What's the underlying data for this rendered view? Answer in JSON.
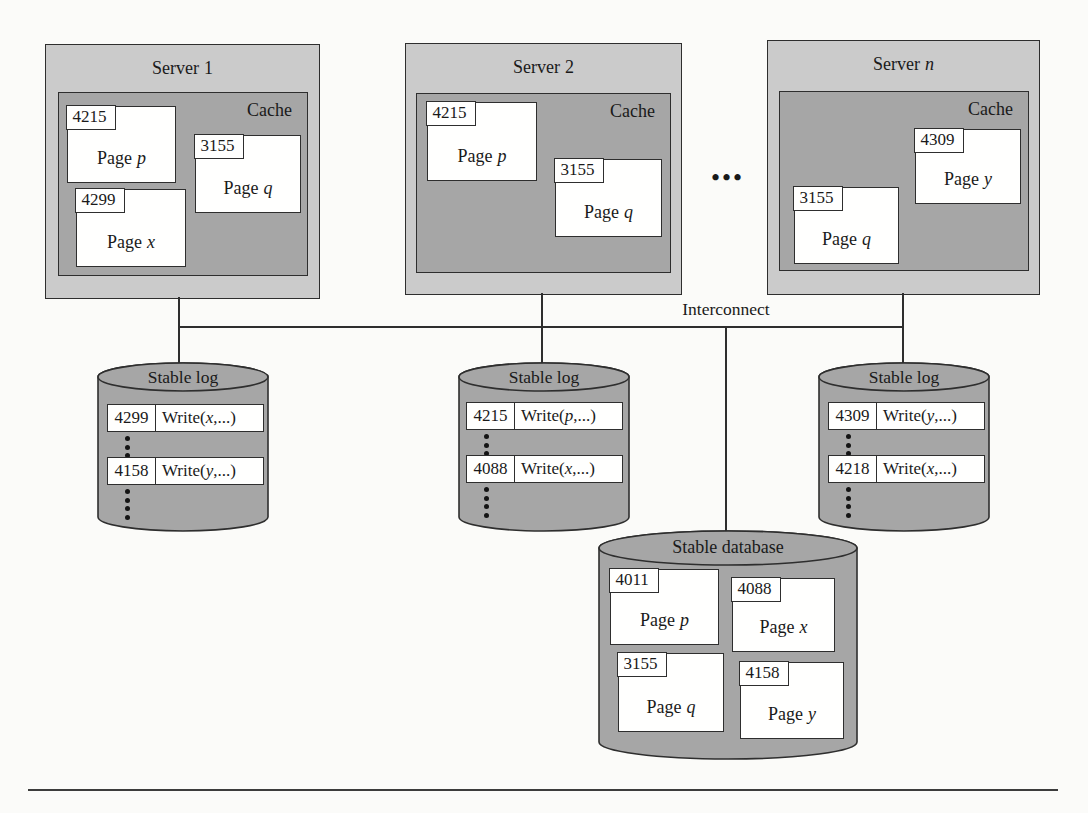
{
  "diagram": {
    "servers": [
      {
        "title_prefix": "Server",
        "title_var": "1",
        "cache_label": "Cache",
        "pages": [
          {
            "tag": "4215",
            "label": "Page",
            "var": "p"
          },
          {
            "tag": "3155",
            "label": "Page",
            "var": "q"
          },
          {
            "tag": "4299",
            "label": "Page",
            "var": "x"
          }
        ]
      },
      {
        "title_prefix": "Server",
        "title_var": "2",
        "cache_label": "Cache",
        "pages": [
          {
            "tag": "4215",
            "label": "Page",
            "var": "p"
          },
          {
            "tag": "3155",
            "label": "Page",
            "var": "q"
          }
        ]
      },
      {
        "title_prefix": "Server",
        "title_var": "n",
        "cache_label": "Cache",
        "pages": [
          {
            "tag": "4309",
            "label": "Page",
            "var": "y"
          },
          {
            "tag": "3155",
            "label": "Page",
            "var": "q"
          }
        ]
      }
    ],
    "servers_ellipsis": "•••",
    "interconnect_label": "Interconnect",
    "logs": [
      {
        "title": "Stable log",
        "records": [
          {
            "lsn": "4299",
            "prefix": "Write(",
            "var": "x",
            "suffix": ",...)"
          },
          {
            "lsn": "4158",
            "prefix": "Write(",
            "var": "y",
            "suffix": ",...)"
          }
        ]
      },
      {
        "title": "Stable log",
        "records": [
          {
            "lsn": "4215",
            "prefix": "Write(",
            "var": "p",
            "suffix": ",...)"
          },
          {
            "lsn": "4088",
            "prefix": "Write(",
            "var": "x",
            "suffix": ",...)"
          }
        ]
      },
      {
        "title": "Stable log",
        "records": [
          {
            "lsn": "4309",
            "prefix": "Write(",
            "var": "y",
            "suffix": ",...)"
          },
          {
            "lsn": "4218",
            "prefix": "Write(",
            "var": "x",
            "suffix": ",...)"
          }
        ]
      }
    ],
    "database": {
      "title": "Stable database",
      "pages": [
        {
          "tag": "4011",
          "label": "Page",
          "var": "p"
        },
        {
          "tag": "4088",
          "label": "Page",
          "var": "x"
        },
        {
          "tag": "3155",
          "label": "Page",
          "var": "q"
        },
        {
          "tag": "4158",
          "label": "Page",
          "var": "y"
        }
      ]
    },
    "colors": {
      "server_fill": "#cbcbcb",
      "cache_fill": "#a6a6a6",
      "cylinder_fill": "#a6a6a6",
      "page_fill": "#ffffff",
      "line_color": "#2e2e2e"
    }
  }
}
